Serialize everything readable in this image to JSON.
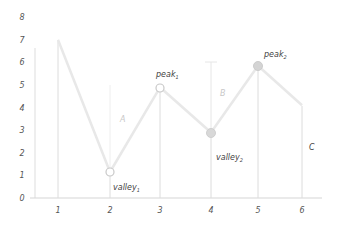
{
  "chart_data": {
    "type": "line",
    "title": "",
    "xlabel": "",
    "ylabel": "",
    "x": [
      1,
      2,
      3,
      4,
      5,
      6
    ],
    "values": [
      7,
      1.15,
      4.9,
      2.9,
      5.85,
      4.1
    ],
    "xlim": [
      0.5,
      6.3
    ],
    "ylim": [
      0,
      8
    ],
    "x_ticks": [
      "1",
      "2",
      "3",
      "4",
      "5",
      "6"
    ],
    "y_ticks": [
      "0",
      "1",
      "2",
      "3",
      "4",
      "5",
      "6",
      "7",
      "8"
    ],
    "grid": false,
    "legend": null,
    "annotations": [
      {
        "text": "valley",
        "subscript": "1",
        "x": 2,
        "y": 1.15,
        "marker": "hollow-circle"
      },
      {
        "text": "peak",
        "subscript": "1",
        "x": 3,
        "y": 4.9,
        "marker": "hollow-circle"
      },
      {
        "text": "valley",
        "subscript": "2",
        "x": 4,
        "y": 2.9,
        "marker": "filled-circle"
      },
      {
        "text": "peak",
        "subscript": "2",
        "x": 5,
        "y": 5.85,
        "marker": "filled-circle"
      },
      {
        "text": "A",
        "type": "vertical-span",
        "x": 2,
        "from": 1.15,
        "to": 5
      },
      {
        "text": "B",
        "type": "vertical-span",
        "x": 4,
        "from": 2.9,
        "to": 6
      },
      {
        "text": "C",
        "type": "vertical-span",
        "x": 6,
        "from": 0,
        "to": 4.1
      }
    ]
  },
  "labels": {
    "valley": "valley",
    "peak": "peak",
    "sub1": "1",
    "sub2": "2",
    "A": "A",
    "B": "B",
    "C": "C"
  }
}
